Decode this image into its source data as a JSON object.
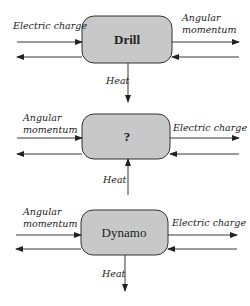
{
  "colors": {
    "box_fill": "#c8c8c8",
    "box_stroke": "#333333",
    "line": "#222222"
  },
  "diagrams": [
    {
      "box_label": "Drill",
      "left_label": "Electric charge",
      "right_label_line1": "Angular",
      "right_label_line2": "momentum",
      "heat_label": "Heat",
      "heat_direction": "out"
    },
    {
      "box_label": "?",
      "left_label_line1": "Angular",
      "left_label_line2": "momentum",
      "right_label": "Electric charge",
      "heat_label": "Heat",
      "heat_direction": "in"
    },
    {
      "box_label": "Dynamo",
      "left_label_line1": "Angular",
      "left_label_line2": "momentum",
      "right_label": "Electric charge",
      "heat_label": "Heat",
      "heat_direction": "out"
    }
  ]
}
